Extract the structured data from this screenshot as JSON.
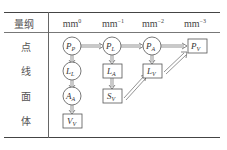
{
  "table": {
    "header_label": "量纲",
    "columns": [
      {
        "base": "mm",
        "exp": "0"
      },
      {
        "base": "mm",
        "exp": "−1"
      },
      {
        "base": "mm",
        "exp": "−2"
      },
      {
        "base": "mm",
        "exp": "−3"
      }
    ],
    "rows": [
      {
        "label": "点"
      },
      {
        "label": "线"
      },
      {
        "label": "面"
      },
      {
        "label": "体"
      }
    ]
  },
  "nodes": [
    {
      "id": "PP",
      "main": "P",
      "sub": "P",
      "shape": "circle",
      "col": 0,
      "row": 0
    },
    {
      "id": "PL",
      "main": "P",
      "sub": "L",
      "shape": "circle",
      "col": 1,
      "row": 0
    },
    {
      "id": "PA",
      "main": "P",
      "sub": "A",
      "shape": "circle",
      "col": 2,
      "row": 0
    },
    {
      "id": "PV",
      "main": "P",
      "sub": "V",
      "shape": "box",
      "col": 3,
      "row": 0
    },
    {
      "id": "LL",
      "main": "L",
      "sub": "L",
      "shape": "circle",
      "col": 0,
      "row": 1
    },
    {
      "id": "LA",
      "main": "L",
      "sub": "A",
      "shape": "box",
      "col": 1,
      "row": 1
    },
    {
      "id": "LV",
      "main": "L",
      "sub": "V",
      "shape": "box",
      "col": 2,
      "row": 1
    },
    {
      "id": "AA",
      "main": "A",
      "sub": "A",
      "shape": "circle",
      "col": 0,
      "row": 2
    },
    {
      "id": "SV",
      "main": "S",
      "sub": "V",
      "shape": "box",
      "col": 1,
      "row": 2
    },
    {
      "id": "VV",
      "main": "V",
      "sub": "V",
      "shape": "box",
      "col": 0,
      "row": 3
    }
  ],
  "edges": [
    {
      "from": "PP",
      "to": "PL"
    },
    {
      "from": "PL",
      "to": "PA"
    },
    {
      "from": "PA",
      "to": "PV"
    },
    {
      "from": "PP",
      "to": "LL"
    },
    {
      "from": "LL",
      "to": "AA"
    },
    {
      "from": "AA",
      "to": "VV"
    },
    {
      "from": "PL",
      "to": "LA"
    },
    {
      "from": "LA",
      "to": "SV"
    },
    {
      "from": "PA",
      "to": "LV"
    },
    {
      "from": "SV",
      "to": "LV"
    },
    {
      "from": "LV",
      "to": "PV"
    }
  ]
}
